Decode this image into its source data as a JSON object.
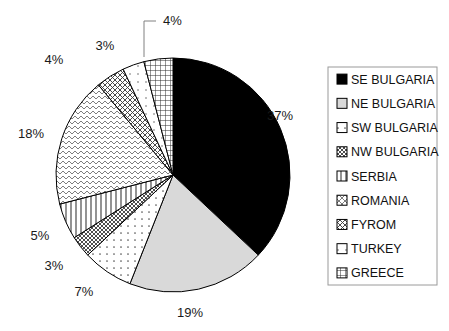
{
  "chart_data": {
    "type": "pie",
    "title": "",
    "subtitle": "",
    "xlabel": "",
    "ylabel": "",
    "grid": false,
    "legend_position": "right",
    "start_angle_deg": 0,
    "direction": "clockwise",
    "categories": [
      "SE BULGARIA",
      "NE BULGARIA",
      "SW BULGARIA",
      "NW BULGARIA",
      "SERBIA",
      "ROMANIA",
      "FYROM",
      "TURKEY",
      "GREECE"
    ],
    "values": [
      37,
      19,
      7,
      3,
      5,
      18,
      4,
      3,
      4
    ],
    "data_labels": [
      "37%",
      "19%",
      "7%",
      "3%",
      "5%",
      "18%",
      "4%",
      "3%",
      "4%"
    ],
    "slices": [
      {
        "label": "SE BULGARIA",
        "value": 37,
        "data_label": "37%",
        "fill_style": "solid-black",
        "fill_color": "#000000",
        "label_x": 267,
        "label_y": 120,
        "leader_line": false
      },
      {
        "label": "NE BULGARIA",
        "value": 19,
        "data_label": "19%",
        "fill_style": "solid-light-gray",
        "fill_color": "#d9d9d9",
        "label_x": 190,
        "label_y": 317,
        "leader_line": false
      },
      {
        "label": "SW BULGARIA",
        "value": 7,
        "data_label": "7%",
        "fill_style": "sparse-dots",
        "fill_color": "#ffffff",
        "label_x": 84,
        "label_y": 296,
        "leader_line": false
      },
      {
        "label": "NW BULGARIA",
        "value": 3,
        "data_label": "3%",
        "fill_style": "dense-diagonal-crosshatch",
        "fill_color": "#ffffff",
        "label_x": 54,
        "label_y": 270,
        "leader_line": false
      },
      {
        "label": "SERBIA",
        "value": 5,
        "data_label": "5%",
        "fill_style": "vertical-lines",
        "fill_color": "#ffffff",
        "label_x": 40,
        "label_y": 240,
        "leader_line": false
      },
      {
        "label": "ROMANIA",
        "value": 18,
        "data_label": "18%",
        "fill_style": "fine-zigzag",
        "fill_color": "#ffffff",
        "label_x": 18,
        "label_y": 138,
        "leader_line": false
      },
      {
        "label": "FYROM",
        "value": 4,
        "data_label": "4%",
        "fill_style": "diagonal-crosshatch",
        "fill_color": "#ffffff",
        "label_x": 54,
        "label_y": 64,
        "leader_line": false
      },
      {
        "label": "TURKEY",
        "value": 3,
        "data_label": "3%",
        "fill_style": "sparse-dots-light",
        "fill_color": "#ffffff",
        "label_x": 105,
        "label_y": 50,
        "leader_line": false
      },
      {
        "label": "GREECE",
        "value": 4,
        "data_label": "4%",
        "fill_style": "grid-crosshatch",
        "fill_color": "#ffffff",
        "label_x": 163,
        "label_y": 25,
        "leader_line": true
      }
    ],
    "geometry": {
      "center_x": 173,
      "center_y": 175,
      "radius": 117
    }
  },
  "legend": {
    "box": {
      "x": 328,
      "y": 67,
      "width": 109,
      "height": 218
    },
    "border_color": "#9a9a9a",
    "items": [
      {
        "label": "SE BULGARIA",
        "swatch": "solid-black"
      },
      {
        "label": "NE BULGARIA",
        "swatch": "solid-light-gray"
      },
      {
        "label": "SW BULGARIA",
        "swatch": "sparse-dots"
      },
      {
        "label": "NW BULGARIA",
        "swatch": "dense-diagonal-crosshatch"
      },
      {
        "label": "SERBIA",
        "swatch": "vertical-lines"
      },
      {
        "label": "ROMANIA",
        "swatch": "diagonal-crosshatch-light"
      },
      {
        "label": "FYROM",
        "swatch": "diagonal-crosshatch"
      },
      {
        "label": "TURKEY",
        "swatch": "sparse-dots-light"
      },
      {
        "label": "GREECE",
        "swatch": "grid-crosshatch"
      }
    ]
  },
  "colors": {
    "outline": "#000000",
    "solid_black": "#000000",
    "solid_light_gray": "#d9d9d9",
    "pattern_ink": "#4a4a4a",
    "background": "#ffffff",
    "label_text": "#1a1a1a"
  }
}
